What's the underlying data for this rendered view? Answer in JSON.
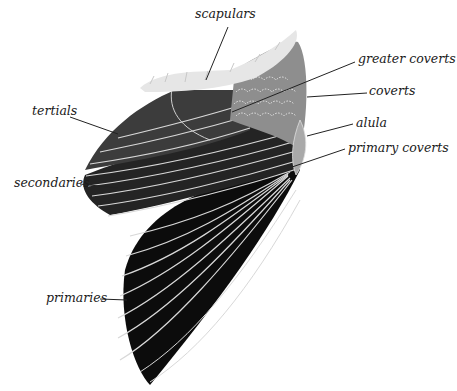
{
  "diagram": {
    "labels": {
      "scapulars": "scapulars",
      "greater_coverts": "greater coverts",
      "coverts": "coverts",
      "alula": "alula",
      "primary_coverts": "primary coverts",
      "tertials": "tertials",
      "secondaries": "secondaries",
      "primaries": "primaries"
    },
    "colors": {
      "primaries": "#0c0c0c",
      "secondaries": "#2a2a2a",
      "tertials": "#3c3c3c",
      "coverts": "#8e8e8e",
      "alula": "#a9a9a9",
      "scapulars": "#e6e6e6",
      "feather_edge": "#d8d8d8",
      "leader_line": "#222222"
    }
  }
}
